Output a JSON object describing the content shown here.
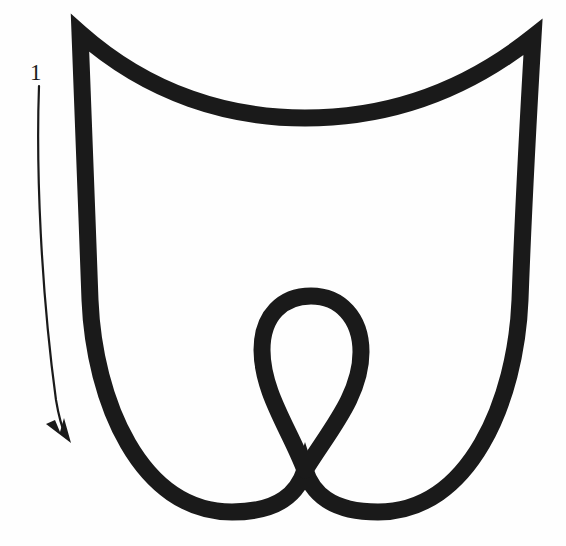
{
  "figure": {
    "kind": "knot-diagram",
    "background_color": "#fefefe",
    "stroke_color": "#1a1a1a",
    "canvas": {
      "width": 566,
      "height": 546
    }
  },
  "annotations": {
    "strand_label": "1",
    "strand_label_position": {
      "x": 36,
      "y": 78
    },
    "orientation_arrow": {
      "name": "orientation-arrow",
      "direction": "downward",
      "start": {
        "x": 39,
        "y": 86
      },
      "end": {
        "x": 66,
        "y": 437
      },
      "stroke_width": 2.2
    }
  },
  "curve": {
    "stroke_width": 17,
    "cusps": [
      {
        "name": "top-left-cusp",
        "x": 80,
        "y": 33
      },
      {
        "name": "top-right-cusp",
        "x": 533,
        "y": 37
      }
    ],
    "crossing": {
      "name": "self-crossing",
      "x": 305,
      "y": 470
    },
    "loop": {
      "name": "central-loop",
      "apex": {
        "x": 311,
        "y": 296
      },
      "left_extent": 262,
      "right_extent": 361
    },
    "extents": {
      "top": 33,
      "bottom": 516,
      "left": 72,
      "right": 534
    },
    "outline_path": "M 80 33 C 150 95 230 118 305 118 C 382 118 460 95 533 37 C 533 37 524 190 520 300 C 516 400 470 512 378 512 C 330 512 312 492 305 470 C 298 492 280 512 232 512 C 140 512 94 400 90 300 C 86 190 80 33 80 33 Z",
    "loop_path": "M 305 470 C 290 430 262 392 262 350 C 262 315 283 296 311 296 C 340 296 361 318 361 352 C 361 396 328 432 305 470"
  }
}
